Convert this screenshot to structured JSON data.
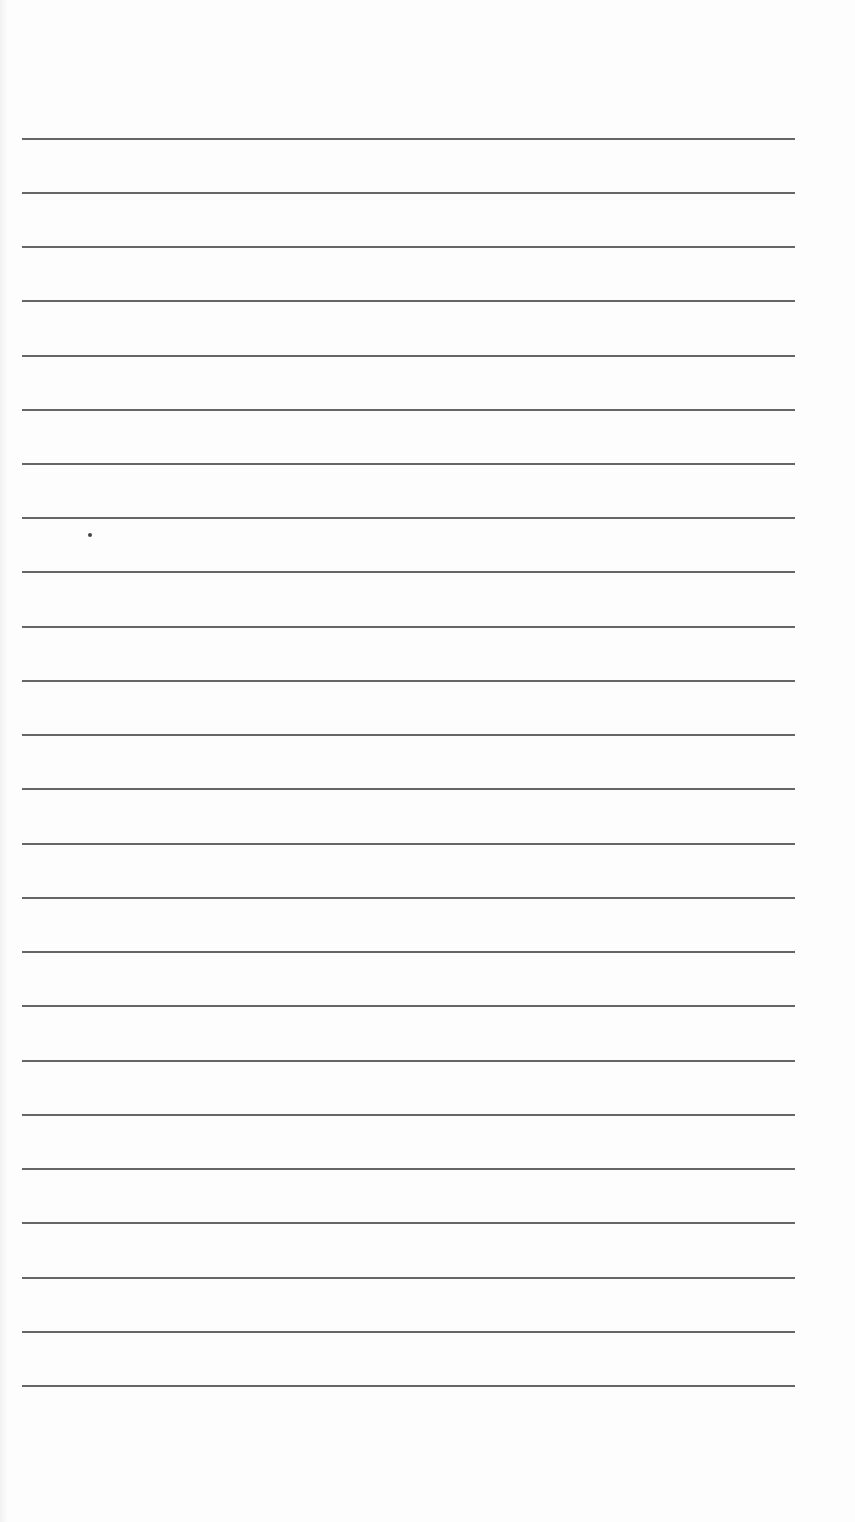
{
  "document": {
    "type": "lined-paper",
    "background_color": "#fdfdfd",
    "rule_color": "#555555",
    "rule_count": 24,
    "rule_left_px": 22,
    "rule_right_px": 795,
    "first_rule_y_px": 138,
    "rule_spacing_px": 54.2,
    "rules": [
      {
        "y": 138
      },
      {
        "y": 192
      },
      {
        "y": 246
      },
      {
        "y": 300
      },
      {
        "y": 355
      },
      {
        "y": 409
      },
      {
        "y": 463
      },
      {
        "y": 517
      },
      {
        "y": 571
      },
      {
        "y": 626
      },
      {
        "y": 680
      },
      {
        "y": 734
      },
      {
        "y": 788
      },
      {
        "y": 843
      },
      {
        "y": 897
      },
      {
        "y": 951
      },
      {
        "y": 1005
      },
      {
        "y": 1060
      },
      {
        "y": 1114
      },
      {
        "y": 1168
      },
      {
        "y": 1222
      },
      {
        "y": 1277
      },
      {
        "y": 1331
      },
      {
        "y": 1385
      }
    ],
    "marks": [
      {
        "kind": "ink-speck",
        "x": 88,
        "y": 533
      }
    ]
  }
}
